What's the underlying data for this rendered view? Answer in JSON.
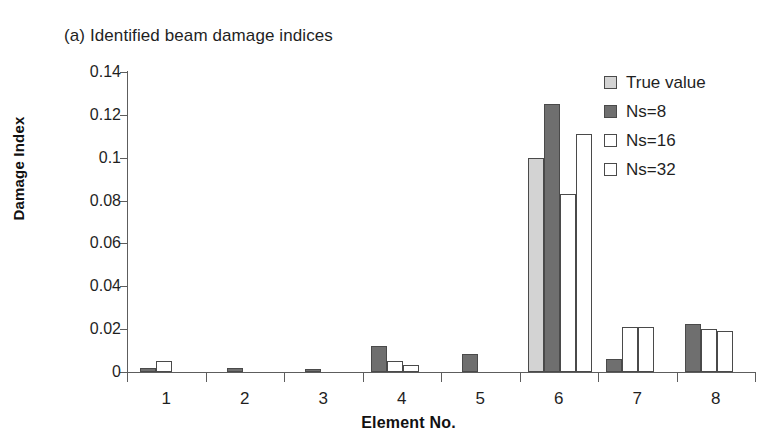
{
  "caption": "(a) Identified beam damage indices",
  "chart_data": {
    "type": "bar",
    "title": "(a) Identified beam damage indices",
    "xlabel": "Element No.",
    "ylabel": "Damage Index",
    "categories": [
      "1",
      "2",
      "3",
      "4",
      "5",
      "6",
      "7",
      "8"
    ],
    "ylim": [
      0,
      0.14
    ],
    "yticks": [
      0,
      0.02,
      0.04,
      0.06,
      0.08,
      0.1,
      0.12,
      0.14
    ],
    "ytick_labels": [
      "0",
      "0.02",
      "0.04",
      "0.06",
      "0.08",
      "0.1",
      "0.12",
      "0.14"
    ],
    "grid": false,
    "legend_position": "top-right",
    "series": [
      {
        "name": "True value",
        "key": "true",
        "color": "#d3d3d3",
        "values": [
          0,
          0,
          0,
          0,
          0,
          0.1,
          0,
          0
        ]
      },
      {
        "name": "Ns=8",
        "key": "ns8",
        "color": "#6f6f6f",
        "values": [
          0.002,
          0.002,
          0.0008,
          0.012,
          0.0085,
          0.125,
          0.006,
          0.0225
        ]
      },
      {
        "name": "Ns=16",
        "key": "ns16",
        "color": "#ffffff",
        "values": [
          0,
          0,
          0,
          0.005,
          0,
          0.083,
          0.021,
          0.02
        ]
      },
      {
        "name": "Ns=32",
        "key": "ns32",
        "color": "#ffffff",
        "values": [
          0.005,
          0,
          0,
          0.0035,
          0,
          0.111,
          0.021,
          0.019
        ]
      }
    ]
  },
  "legend": {
    "items": [
      {
        "label": "True value",
        "key": "true"
      },
      {
        "label": "Ns=8",
        "key": "ns8"
      },
      {
        "label": "Ns=16",
        "key": "ns16"
      },
      {
        "label": "Ns=32",
        "key": "ns32"
      }
    ]
  },
  "colors": {
    "true_value": "#d3d3d3",
    "ns8": "#6f6f6f",
    "ns16": "#ffffff",
    "ns32": "#ffffff",
    "axis": "#5d5d5d",
    "bar_outline": "#4a4a4a",
    "text": "#1f1f1f",
    "background": "#ffffff"
  }
}
